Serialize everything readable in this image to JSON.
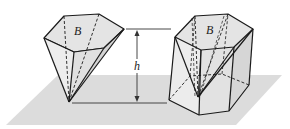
{
  "figure": {
    "labels": {
      "pyramid_base": "B",
      "prism_base": "B",
      "height": "h"
    },
    "colors": {
      "plane": "#d9d9d9",
      "face": "#e6e6e6",
      "edge": "#1a1a1a",
      "background": "#ffffff"
    }
  }
}
